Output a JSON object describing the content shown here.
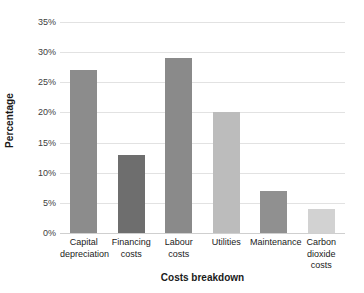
{
  "chart_data": {
    "type": "bar",
    "title": "",
    "subtitle": "",
    "xlabel": "Costs breakdown",
    "ylabel": "Percentage",
    "categories": [
      "Capital depreciation",
      "Financing costs",
      "Labour costs",
      "Utilities",
      "Maintenance",
      "Carbon dioxide costs"
    ],
    "category_lines": [
      "Capital\ndepreciation",
      "Financing\ncosts",
      "Labour costs",
      "Utilities",
      "Maintenance",
      "Carbon\ndioxide costs"
    ],
    "values": [
      27,
      13,
      29,
      20,
      7,
      4
    ],
    "value_labels": [
      "27%",
      "13%",
      "29%",
      "20%",
      "7%",
      "4%"
    ],
    "bar_colors": [
      "#8c8c8c",
      "#6e6e6e",
      "#8a8a8a",
      "#bcbcbc",
      "#909090",
      "#d2d2d2"
    ],
    "ylim": [
      0,
      35
    ],
    "ytick_values": [
      0,
      5,
      10,
      15,
      20,
      25,
      30,
      35
    ],
    "ytick_labels": [
      "0%",
      "5%",
      "10%",
      "15%",
      "20%",
      "25%",
      "30%",
      "35%"
    ],
    "grid": true,
    "grid_color": "#e2e2e2",
    "legend": false,
    "legend_position": "none",
    "background": "#ffffff",
    "axis_label_color": "#1a1a1a",
    "tick_label_color": "#404040"
  }
}
